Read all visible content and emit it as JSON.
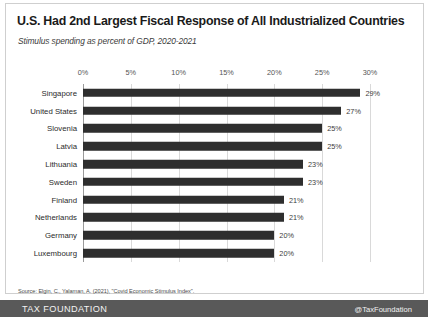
{
  "chart_data": {
    "type": "bar",
    "orientation": "horizontal",
    "title": "U.S. Had 2nd Largest Fiscal Response of All Industrialized Countries",
    "subtitle": "Stimulus spending as percent of GDP, 2020-2021",
    "xlabel": "",
    "ylabel": "",
    "xlim": [
      0,
      30
    ],
    "xticks": [
      "0%",
      "5%",
      "10%",
      "15%",
      "20%",
      "25%",
      "30%"
    ],
    "xtick_values": [
      0,
      5,
      10,
      15,
      20,
      25,
      30
    ],
    "grid": true,
    "legend": false,
    "bar_color": "#2e2e2e",
    "categories": [
      "Singapore",
      "United States",
      "Slovenia",
      "Latvia",
      "Lithuania",
      "Sweden",
      "Finland",
      "Netherlands",
      "Germany",
      "Luxembourg"
    ],
    "values": [
      29,
      27,
      25,
      25,
      23,
      23,
      21,
      21,
      20,
      20
    ],
    "value_labels": [
      "29%",
      "27%",
      "25%",
      "25%",
      "23%",
      "23%",
      "21%",
      "21%",
      "20%",
      "20%"
    ],
    "source": "Source: Elgin, C., Yalaman, A. (2021), \"Covid Economic Stimulus Index\"."
  },
  "footer": {
    "logo": "TAX FOUNDATION",
    "handle": "@TaxFoundation"
  }
}
